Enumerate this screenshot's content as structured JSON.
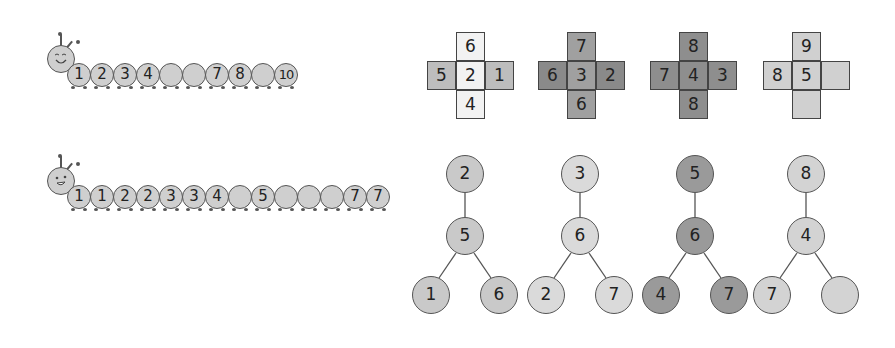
{
  "caterpillars": [
    {
      "face": "smiling-eyes-closed",
      "segments": [
        "1",
        "2",
        "3",
        "4",
        "",
        "",
        "7",
        "8",
        "",
        "10"
      ]
    },
    {
      "face": "open-eyes-smile",
      "segments": [
        "1",
        "1",
        "2",
        "2",
        "3",
        "3",
        "4",
        "",
        "5",
        "",
        "",
        "",
        "7",
        "7"
      ]
    }
  ],
  "crosses": [
    {
      "shade": "#f2f2f2",
      "top": "6",
      "left": "5",
      "center": "2",
      "right": "1",
      "bottom": "4",
      "leftShade": "#bdbdbd",
      "rightShade": "#bdbdbd"
    },
    {
      "shade": "#a0a0a0",
      "top": "7",
      "left": "6",
      "center": "3",
      "right": "2",
      "bottom": "6",
      "leftShade": "#8a8a8a",
      "rightShade": "#8a8a8a"
    },
    {
      "shade": "#8e8e8e",
      "top": "8",
      "left": "7",
      "center": "4",
      "right": "3",
      "bottom": "8",
      "leftShade": "#8e8e8e",
      "rightShade": "#8e8e8e"
    },
    {
      "shade": "#d0d0d0",
      "top": "9",
      "left": "8",
      "center": "5",
      "right": "",
      "bottom": "",
      "leftShade": "#d0d0d0",
      "rightShade": "#d0d0d0"
    }
  ],
  "trees": [
    {
      "shade": "#c9c9c9",
      "top": "2",
      "middle": "5",
      "left": "1",
      "right": "6"
    },
    {
      "shade": "#dadada",
      "top": "3",
      "middle": "6",
      "left": "2",
      "right": "7"
    },
    {
      "shade": "#9a9a9a",
      "top": "5",
      "middle": "6",
      "left": "4",
      "right": "7"
    },
    {
      "shade": "#d3d3d3",
      "top": "8",
      "middle": "4",
      "left": "7",
      "right": ""
    }
  ]
}
